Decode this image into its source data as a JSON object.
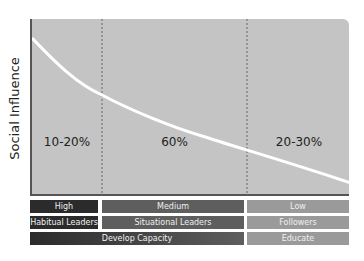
{
  "diagram": {
    "y_axis_label": "Social Influence",
    "segments": [
      {
        "label": "10-20%",
        "influence": "High",
        "role": "Habitual Leaders"
      },
      {
        "label": "60%",
        "influence": "Medium",
        "role": "Situational Leaders"
      },
      {
        "label": "20-30%",
        "influence": "Low",
        "role": "Followers"
      }
    ],
    "actions": [
      {
        "label": "Develop Capacity",
        "spans": "High + Medium"
      },
      {
        "label": "Educate",
        "spans": "Low"
      }
    ],
    "colors": {
      "plot_bg": "#c4c4c4",
      "curve": "#ffffff",
      "high": "#2b2b2b",
      "medium": "#5e5e5e",
      "low": "#9a9a9a"
    }
  }
}
